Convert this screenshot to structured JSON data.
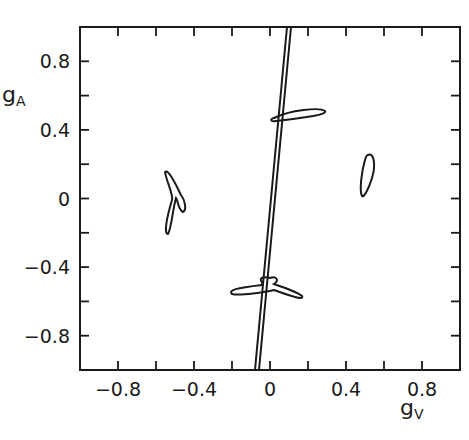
{
  "chart_data": {
    "type": "scatter",
    "title": "",
    "xlabel": "g_V",
    "ylabel": "g_A",
    "xlim": [
      -1.0,
      1.0
    ],
    "ylim": [
      -1.0,
      1.0
    ],
    "grid": false,
    "x_ticks": [
      "-0.8",
      "-0.4",
      "0",
      "0.4",
      "0.8"
    ],
    "y_ticks": [
      "0.8",
      "0.4",
      "0",
      "-0.4",
      "-0.8"
    ],
    "minor_ticks_step": 0.2,
    "series": [
      {
        "name": "band",
        "kind": "line",
        "description": "narrow double-line band",
        "x": [
          -0.04,
          0.11
        ],
        "y": [
          -1.0,
          1.0
        ]
      },
      {
        "name": "contour-upper",
        "kind": "closed-contour",
        "center": [
          0.17,
          0.48
        ],
        "extent_x": [
          0.05,
          0.3
        ],
        "extent_y": [
          0.46,
          0.51
        ]
      },
      {
        "name": "contour-right",
        "kind": "closed-contour",
        "center": [
          0.53,
          0.14
        ],
        "extent_x": [
          0.5,
          0.56
        ],
        "extent_y": [
          0.0,
          0.26
        ]
      },
      {
        "name": "contour-left",
        "kind": "closed-contour",
        "center": [
          -0.46,
          -0.03
        ],
        "extent_x": [
          -0.52,
          -0.42
        ],
        "extent_y": [
          -0.22,
          0.16
        ]
      },
      {
        "name": "contour-lower",
        "kind": "closed-contour",
        "center": [
          -0.01,
          -0.5
        ],
        "extent_x": [
          -0.2,
          0.19
        ],
        "extent_y": [
          -0.6,
          -0.48
        ]
      }
    ]
  },
  "axes": {
    "x_label_main": "g",
    "x_label_sub": "V",
    "y_label_main": "g",
    "y_label_sub": "A"
  }
}
